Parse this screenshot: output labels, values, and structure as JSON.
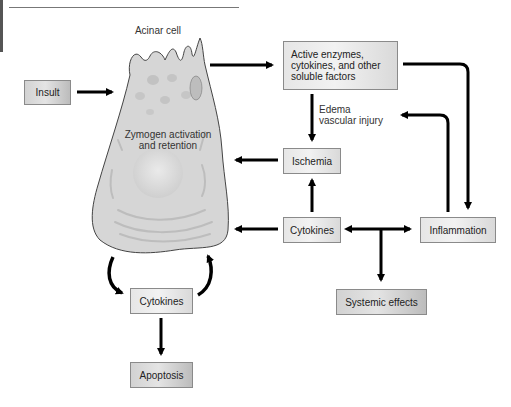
{
  "diagram": {
    "cell_label": "Acinar cell",
    "cell_inner_label": [
      "Zymogen activation",
      "and retention"
    ],
    "edge_label": [
      "Edema",
      "vascular injury"
    ],
    "nodes": {
      "insult": "Insult",
      "active_factors": [
        "Active enzymes,",
        "cytokines, and  other",
        "soluble factors"
      ],
      "ischemia": "Ischemia",
      "cytokines_main": "Cytokines",
      "inflammation": "Inflammation",
      "systemic_effects": "Systemic effects",
      "cytokines_loop": "Cytokines",
      "apoptosis": "Apoptosis"
    },
    "edges": [
      {
        "from": "Insult",
        "to": "Acinar cell"
      },
      {
        "from": "Acinar cell",
        "to": "Active enzymes, cytokines, and other soluble factors"
      },
      {
        "from": "Active enzymes, cytokines, and other soluble factors",
        "to": "Ischemia",
        "label": "Edema vascular injury"
      },
      {
        "from": "Active enzymes, cytokines, and other soluble factors",
        "to": "Inflammation"
      },
      {
        "from": "Inflammation",
        "to": "Edema vascular injury"
      },
      {
        "from": "Ischemia",
        "to": "Acinar cell"
      },
      {
        "from": "Cytokines",
        "to": "Ischemia"
      },
      {
        "from": "Cytokines",
        "to": "Acinar cell"
      },
      {
        "from": "Cytokines",
        "to": "Inflammation"
      },
      {
        "from": "Inflammation",
        "to": "Cytokines"
      },
      {
        "from": "Cytokines",
        "to": "Systemic effects"
      },
      {
        "from": "Acinar cell",
        "to": "Cytokines (loop)"
      },
      {
        "from": "Cytokines (loop)",
        "to": "Acinar cell"
      },
      {
        "from": "Cytokines (loop)",
        "to": "Apoptosis"
      }
    ],
    "colors": {
      "box_fill": "#e6e6e6",
      "cell_fill": "#d8d8d8",
      "arrow": "#000000"
    }
  }
}
